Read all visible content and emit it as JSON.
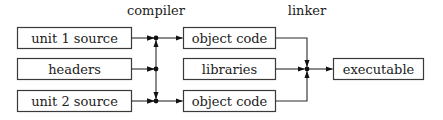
{
  "stages": {
    "compiler": "compiler",
    "linker": "linker"
  },
  "inputs": [
    {
      "label": "unit 1 source"
    },
    {
      "label": "headers"
    },
    {
      "label": "unit 2 source"
    }
  ],
  "intermediates": [
    {
      "label": "object code"
    },
    {
      "label": "libraries"
    },
    {
      "label": "object code"
    }
  ],
  "output": {
    "label": "executable"
  },
  "colors": {
    "stroke": "#3a3a3a",
    "text": "#222222",
    "background": "#ffffff"
  }
}
